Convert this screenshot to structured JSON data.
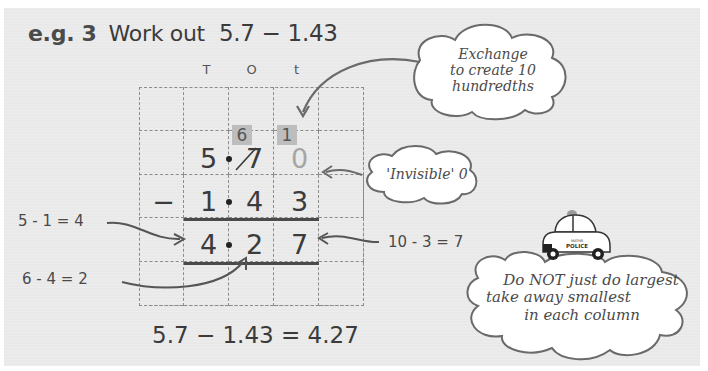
{
  "example": {
    "label": "e.g. 3",
    "instruction": "Work out",
    "expression": "5.7 − 1.43"
  },
  "grid": {
    "column_headers": [
      "T",
      "O",
      "t"
    ],
    "carries": {
      "ones": "6",
      "tenths": "1"
    },
    "row1": {
      "units": "5",
      "tenths_original": "7",
      "hundredths": "0"
    },
    "row2": {
      "sign": "−",
      "units": "1",
      "tenths": "4",
      "hundredths": "3"
    },
    "result": {
      "units": "4",
      "tenths": "2",
      "hundredths": "7"
    }
  },
  "annotations": {
    "units_step": "5 - 1 = 4",
    "tenths_step": "6 - 4 = 2",
    "hundredths_step": "10 - 3 = 7"
  },
  "clouds": {
    "exchange": [
      "Exchange",
      "to create 10",
      "hundredths"
    ],
    "invisible_zero": "'Invisible' 0",
    "warning": [
      "Do NOT just do largest",
      "take away smallest",
      "in each column"
    ]
  },
  "police_car": {
    "top_text": "MATHS",
    "label": "POLICE"
  },
  "answer": "5.7 − 1.43 = 4.27",
  "colors": {
    "page_background": "#e9e9e9",
    "text": "#3b3b3b",
    "carry_box": "#bdbdbd",
    "invisible_digit": "#a5a5a5"
  }
}
